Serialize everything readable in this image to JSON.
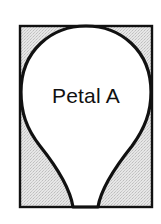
{
  "diagram": {
    "label": "Petal A",
    "colors": {
      "stroke": "#111111",
      "background_fill": "#d9d9d9",
      "petal_fill": "#ffffff"
    }
  }
}
